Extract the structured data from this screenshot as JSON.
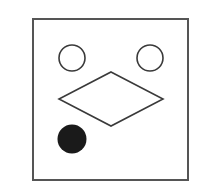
{
  "diagram": {
    "width": 202,
    "height": 196,
    "background": "#ffffff",
    "stroke_color": "#3a3a3a",
    "frame": {
      "shape": "square",
      "x": 33,
      "y": 19,
      "width": 155,
      "height": 161,
      "stroke": "#555555",
      "stroke_width": 2,
      "fill": "none"
    },
    "shapes": [
      {
        "id": "left-circle",
        "type": "circle",
        "cx": 72,
        "cy": 58,
        "r": 13,
        "fill": "none",
        "stroke": "#3a3a3a",
        "stroke_width": 1.6
      },
      {
        "id": "right-circle",
        "type": "circle",
        "cx": 150,
        "cy": 58,
        "r": 13,
        "fill": "none",
        "stroke": "#3a3a3a",
        "stroke_width": 1.6
      },
      {
        "id": "diamond",
        "type": "polygon",
        "points": "111,72 163,99 111,126 59,99",
        "fill": "none",
        "stroke": "#3a3a3a",
        "stroke_width": 1.6
      },
      {
        "id": "filled-circle",
        "type": "circle",
        "cx": 72,
        "cy": 139,
        "r": 14.5,
        "fill": "#1a1a1a",
        "stroke": "none",
        "stroke_width": 0
      }
    ]
  }
}
